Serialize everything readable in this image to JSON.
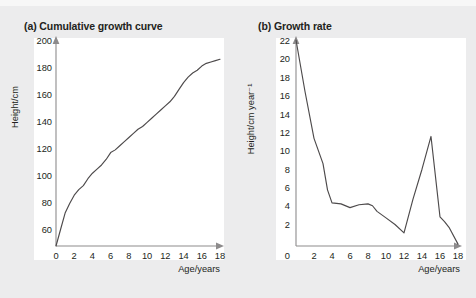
{
  "figure": {
    "background_color": "#ececed",
    "panel_background_color": "#ffffff",
    "axis_color": "#8d8b8c",
    "curve_color": "#4d4a4b",
    "text_color": "#231f20"
  },
  "panels": [
    {
      "key": "a",
      "title": "(a) Cumulative growth curve",
      "label_prefix": "(a)",
      "label_text": "Cumulative growth curve"
    },
    {
      "key": "b",
      "title": "(b) Growth rate",
      "label_prefix": "(b)",
      "label_text": "Growth rate"
    }
  ],
  "chart_data": [
    {
      "type": "line",
      "title": "(a) Cumulative growth curve",
      "xlabel": "Age/years",
      "ylabel": "Height/cm",
      "xlim": [
        0,
        18
      ],
      "ylim": [
        50,
        200
      ],
      "xticks": [
        0,
        2,
        4,
        6,
        8,
        10,
        12,
        14,
        16,
        18
      ],
      "yticks": [
        60,
        80,
        100,
        120,
        140,
        160,
        180,
        200
      ],
      "xtick_labels": [
        "0",
        "2",
        "4",
        "6",
        "8",
        "10",
        "12",
        "14",
        "16",
        "18"
      ],
      "ytick_labels": [
        "60",
        "80",
        "100",
        "120",
        "140",
        "160",
        "180",
        "200"
      ],
      "grid": false,
      "legend": "none",
      "series": [
        {
          "name": "Cumulative height",
          "x": [
            0,
            0.5,
            1,
            1.5,
            2,
            2.5,
            3,
            3.5,
            4,
            4.5,
            5,
            5.5,
            6,
            6.5,
            7,
            7.5,
            8,
            8.5,
            9,
            9.5,
            10,
            10.5,
            11,
            11.5,
            12,
            12.5,
            13,
            13.5,
            14,
            14.5,
            15,
            15.5,
            16,
            16.5,
            17,
            17.5,
            18
          ],
          "y": [
            50,
            62,
            74,
            81,
            87,
            91,
            94,
            99,
            103,
            106,
            109,
            113,
            118,
            120,
            123,
            126,
            129,
            132,
            135,
            137,
            140,
            143,
            146,
            149,
            152,
            155,
            159,
            164,
            169,
            173,
            176,
            178,
            181,
            183,
            184,
            185,
            186
          ]
        }
      ]
    },
    {
      "type": "line",
      "title": "(b) Growth rate",
      "xlabel": "Age/years",
      "ylabel": "Height/cm year⁻¹",
      "xlim": [
        0,
        18
      ],
      "ylim": [
        0,
        22
      ],
      "xticks": [
        0,
        2,
        4,
        6,
        8,
        10,
        12,
        14,
        16,
        18
      ],
      "yticks": [
        0,
        2,
        4,
        6,
        8,
        10,
        12,
        14,
        16,
        18,
        20,
        22
      ],
      "xtick_labels": [
        "0",
        "2",
        "4",
        "6",
        "8",
        "10",
        "12",
        "14",
        "16",
        "18"
      ],
      "ytick_labels": [
        "0",
        "2",
        "4",
        "6",
        "8",
        "10",
        "12",
        "14",
        "16",
        "18",
        "20",
        "22"
      ],
      "grid": false,
      "legend": "none",
      "series": [
        {
          "name": "Growth rate",
          "x": [
            0,
            1,
            2,
            3,
            3.5,
            4,
            5,
            6,
            7,
            8,
            8.5,
            9,
            10,
            11,
            12,
            13,
            14,
            15,
            16,
            16.5,
            17,
            18
          ],
          "y": [
            22.0,
            16.5,
            11.5,
            8.8,
            6.0,
            4.6,
            4.5,
            4.1,
            4.4,
            4.5,
            4.3,
            3.7,
            3.0,
            2.3,
            1.4,
            5.0,
            8.2,
            11.7,
            3.1,
            2.6,
            2.0,
            0.2
          ]
        }
      ]
    }
  ]
}
